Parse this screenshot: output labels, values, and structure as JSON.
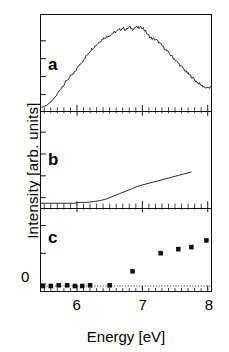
{
  "figure": {
    "axis_labels": {
      "x": "Energy  [eV]",
      "y": "Intensity [arb. units]",
      "zero": "0"
    },
    "panel_labels": {
      "a": "a",
      "b": "b",
      "c": "c"
    },
    "x_tick_labels": [
      "6",
      "7",
      "8"
    ]
  },
  "chart_data": [
    {
      "type": "line",
      "panel": "a",
      "title": "",
      "xlabel": "Energy  [eV]",
      "ylabel": "Intensity [arb. units]",
      "xlim": [
        5.45,
        8.05
      ],
      "ylim": [
        0,
        1.05
      ],
      "grid": false,
      "legend": null,
      "x": [
        5.45,
        5.5,
        5.55,
        5.6,
        5.65,
        5.7,
        5.75,
        5.8,
        5.85,
        5.9,
        5.95,
        6.0,
        6.05,
        6.1,
        6.15,
        6.2,
        6.25,
        6.3,
        6.35,
        6.4,
        6.45,
        6.5,
        6.55,
        6.6,
        6.65,
        6.7,
        6.75,
        6.8,
        6.85,
        6.9,
        6.95,
        7.0,
        7.05,
        7.1,
        7.15,
        7.2,
        7.25,
        7.3,
        7.35,
        7.4,
        7.45,
        7.5,
        7.55,
        7.6,
        7.65,
        7.7,
        7.75,
        7.8,
        7.85,
        7.9,
        7.95,
        8.0,
        8.05
      ],
      "y": [
        0.02,
        0.03,
        0.05,
        0.08,
        0.12,
        0.17,
        0.23,
        0.28,
        0.33,
        0.37,
        0.4,
        0.46,
        0.52,
        0.55,
        0.61,
        0.66,
        0.7,
        0.73,
        0.77,
        0.8,
        0.82,
        0.84,
        0.86,
        0.88,
        0.9,
        0.92,
        0.9,
        0.93,
        0.91,
        0.93,
        0.92,
        0.93,
        0.88,
        0.83,
        0.8,
        0.79,
        0.76,
        0.72,
        0.68,
        0.64,
        0.6,
        0.56,
        0.52,
        0.48,
        0.44,
        0.4,
        0.37,
        0.33,
        0.3,
        0.27,
        0.25,
        0.24,
        0.24
      ]
    },
    {
      "type": "line",
      "panel": "b",
      "title": "",
      "xlabel": "Energy  [eV]",
      "ylabel": "Intensity [arb. units]",
      "xlim": [
        5.45,
        8.05
      ],
      "ylim": [
        0,
        1.05
      ],
      "grid": false,
      "legend": null,
      "x": [
        5.45,
        5.55,
        5.65,
        5.75,
        5.85,
        5.95,
        6.05,
        6.15,
        6.25,
        6.35,
        6.45,
        6.55,
        6.65,
        6.75,
        6.85,
        6.95,
        7.05,
        7.15,
        7.25,
        7.35,
        7.45,
        7.55,
        7.65,
        7.75
      ],
      "y": [
        0.02,
        0.02,
        0.02,
        0.02,
        0.02,
        0.02,
        0.03,
        0.03,
        0.04,
        0.05,
        0.07,
        0.1,
        0.13,
        0.16,
        0.19,
        0.22,
        0.24,
        0.26,
        0.28,
        0.3,
        0.32,
        0.34,
        0.36,
        0.38
      ]
    },
    {
      "type": "scatter",
      "panel": "c",
      "title": "",
      "xlabel": "Energy  [eV]",
      "ylabel": "Intensity [arb. units]",
      "xlim": [
        5.45,
        8.05
      ],
      "ylim": [
        -0.06,
        1.0
      ],
      "grid": false,
      "zero_line": 0,
      "marker": "filled-square",
      "legend": null,
      "x": [
        5.48,
        5.6,
        5.72,
        5.85,
        5.97,
        6.08,
        6.2,
        6.5,
        6.85,
        7.28,
        7.55,
        7.75,
        7.98
      ],
      "y": [
        0.0,
        0.0,
        0.01,
        0.01,
        0.0,
        0.0,
        0.01,
        0.01,
        0.22,
        0.49,
        0.55,
        0.58,
        0.68
      ]
    }
  ]
}
